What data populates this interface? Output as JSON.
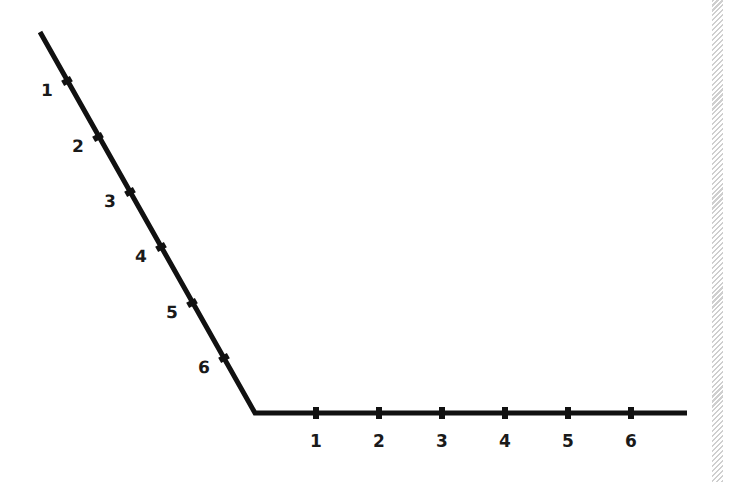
{
  "diagram": {
    "line_color": "#111111",
    "slanted_axis": {
      "start": [
        40,
        32
      ],
      "end": [
        255,
        413
      ],
      "ticks": [
        {
          "label": "1",
          "pos": [
            67,
            81
          ]
        },
        {
          "label": "2",
          "pos": [
            98,
            137
          ]
        },
        {
          "label": "3",
          "pos": [
            130,
            192
          ]
        },
        {
          "label": "4",
          "pos": [
            161,
            247
          ]
        },
        {
          "label": "5",
          "pos": [
            192,
            303
          ]
        },
        {
          "label": "6",
          "pos": [
            224,
            358
          ]
        }
      ]
    },
    "horizontal_axis": {
      "start": [
        255,
        413
      ],
      "end": [
        687,
        413
      ],
      "ticks": [
        {
          "label": "1",
          "pos": [
            316,
            413
          ]
        },
        {
          "label": "2",
          "pos": [
            379,
            413
          ]
        },
        {
          "label": "3",
          "pos": [
            442,
            413
          ]
        },
        {
          "label": "4",
          "pos": [
            505,
            413
          ]
        },
        {
          "label": "5",
          "pos": [
            568,
            413
          ]
        },
        {
          "label": "6",
          "pos": [
            631,
            413
          ]
        }
      ]
    }
  }
}
